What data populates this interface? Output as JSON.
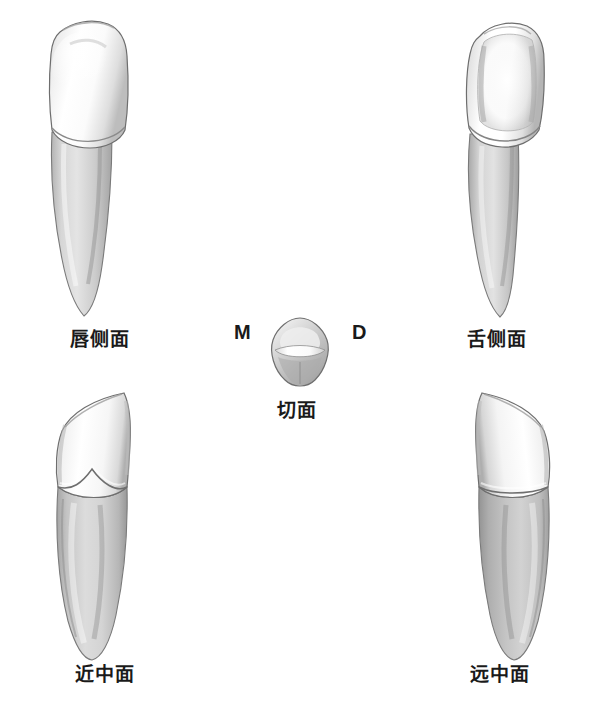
{
  "figure": {
    "background_color": "#ffffff",
    "ink_color": "#1a1a1a"
  },
  "palette": {
    "enamel_light": "#ffffff",
    "enamel_mid": "#e6e6e6",
    "enamel_shadow": "#b8b8b8",
    "root_light": "#dcdcdc",
    "root_mid": "#c2c2c2",
    "root_shadow": "#9a9a9a",
    "outline": "#6e6e6e",
    "outline_dark": "#4a4a4a"
  },
  "views": [
    {
      "id": "labial",
      "label": "唇侧面",
      "position": "top-left",
      "description": "labial-surface-view"
    },
    {
      "id": "lingual",
      "label": "舌侧面",
      "position": "top-right",
      "description": "lingual-surface-view"
    },
    {
      "id": "incisal",
      "label": "切面",
      "position": "center",
      "description": "incisal-surface-view"
    },
    {
      "id": "mesial",
      "label": "近中面",
      "position": "bottom-left",
      "description": "mesial-surface-view"
    },
    {
      "id": "distal",
      "label": "远中面",
      "position": "bottom-right",
      "description": "distal-surface-view"
    }
  ],
  "orientation_markers": {
    "mesial": "M",
    "distal": "D"
  }
}
